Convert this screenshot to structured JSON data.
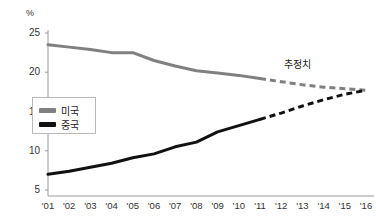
{
  "chart_data": {
    "type": "line",
    "title": "",
    "subtitle": "",
    "xlabel": "",
    "ylabel": "%",
    "unit_label": "%",
    "x": [
      "'01",
      "'02",
      "'03",
      "'04",
      "'05",
      "'06",
      "'07",
      "'08",
      "'09",
      "'10",
      "'11",
      "'12",
      "'13",
      "'14",
      "'15",
      "'16"
    ],
    "xtick_labels": [
      "'01",
      "'02",
      "'03",
      "'04",
      "'05",
      "'06",
      "'07",
      "'08",
      "'09",
      "'10",
      "'11",
      "'12",
      "'13",
      "'14",
      "'15",
      "'16"
    ],
    "ytick_labels": [
      "25",
      "20",
      "15",
      "10",
      "5"
    ],
    "yticks": [
      25,
      20,
      15,
      10,
      5
    ],
    "ylim": [
      5,
      26
    ],
    "xlim": [
      "'01",
      "'16"
    ],
    "grid": false,
    "legend_position": "inner-left",
    "forecast_start": "'11",
    "annotations": [
      {
        "text": "추정치",
        "x": "'14",
        "y": 20.1
      }
    ],
    "series": [
      {
        "name": "미국",
        "color": "#808080",
        "values": [
          23.5,
          23.2,
          22.9,
          22.5,
          22.5,
          21.5,
          20.8,
          20.2,
          19.9,
          19.6,
          19.2,
          18.8,
          18.4,
          18.1,
          17.9,
          17.7
        ],
        "actual_through": "'11",
        "style": "solid-then-dashed"
      },
      {
        "name": "중국",
        "color": "#111111",
        "values": [
          7.0,
          7.4,
          7.9,
          8.4,
          9.1,
          9.6,
          10.5,
          11.1,
          12.4,
          13.2,
          14.0,
          14.8,
          15.7,
          16.5,
          17.2,
          17.7
        ],
        "actual_through": "'11",
        "style": "solid-then-dashed"
      }
    ]
  },
  "legend": {
    "items": [
      {
        "label": "미국",
        "color": "#808080"
      },
      {
        "label": "중국",
        "color": "#111111"
      }
    ]
  },
  "annotation": {
    "estimate_label": "추정치"
  },
  "axes": {
    "y_unit": "%",
    "y_labels": [
      "25",
      "20",
      "15",
      "10",
      "5"
    ],
    "x_labels": [
      "'01",
      "'02",
      "'03",
      "'04",
      "'05",
      "'06",
      "'07",
      "'08",
      "'09",
      "'10",
      "'11",
      "'12",
      "'13",
      "'14",
      "'15",
      "'16"
    ]
  },
  "colors": {
    "usa": "#808080",
    "china": "#111111",
    "axis": "#9a9a9a",
    "text": "#333333"
  }
}
